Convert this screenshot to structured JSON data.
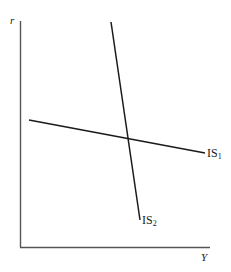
{
  "diagram": {
    "type": "IS curves",
    "axes": {
      "y_label": "r",
      "x_label": "Y",
      "color": "#555555"
    },
    "curves": [
      {
        "name": "IS",
        "subscript": "1",
        "slope": "flat (negative)",
        "color": "#1a1a1a"
      },
      {
        "name": "IS",
        "subscript": "2",
        "slope": "steep (negative)",
        "color": "#1a1a1a"
      }
    ],
    "geometry": {
      "origin": [
        21,
        247
      ],
      "y_axis_top": [
        20,
        21
      ],
      "x_axis_end": [
        210,
        247
      ],
      "is1": {
        "start": [
          29,
          120
        ],
        "end": [
          205,
          153
        ]
      },
      "is2": {
        "start": [
          111,
          22
        ],
        "end": [
          140,
          220
        ]
      }
    }
  }
}
